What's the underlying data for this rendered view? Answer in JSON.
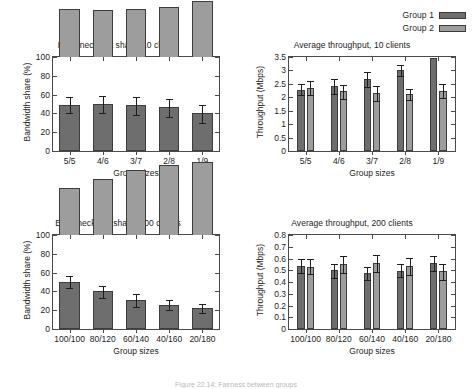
{
  "figure": {
    "caption": "Figure 22.14:  Fairness between groups",
    "legend": {
      "position": "top-right",
      "entries": [
        {
          "label": "Group 1",
          "color": "#6e6e6e"
        },
        {
          "label": "Group 2",
          "color": "#9d9d9d"
        }
      ]
    }
  },
  "chart_data": [
    {
      "id": "bottleneck-10",
      "type": "bar",
      "stacked": true,
      "title": "Bottleneck link share, 10 clients",
      "xlabel": "Group sizes",
      "ylabel": "Bandwidth share (%)",
      "categories": [
        "5/5",
        "4/6",
        "3/7",
        "2/8",
        "1/9"
      ],
      "ylim": [
        0,
        100
      ],
      "yticks": [
        0,
        20,
        40,
        60,
        80,
        100
      ],
      "ytick_labels": [
        "0",
        "20",
        "40",
        "60",
        "80",
        "100"
      ],
      "grid": false,
      "series": [
        {
          "name": "Group 1",
          "color": "#6e6e6e",
          "values": [
            49,
            50,
            49,
            47,
            40
          ],
          "err_low": [
            9,
            10,
            11,
            11,
            10
          ],
          "err_high": [
            8,
            9,
            8,
            8,
            9
          ]
        },
        {
          "name": "Group 2",
          "color": "#9d9d9d",
          "values": [
            51,
            50,
            51,
            53,
            60
          ]
        }
      ]
    },
    {
      "id": "throughput-10",
      "type": "bar",
      "stacked": false,
      "title": "Average throughput, 10 clients",
      "xlabel": "Group sizes",
      "ylabel": "Throughput (Mbps)",
      "categories": [
        "5/5",
        "4/6",
        "3/7",
        "2/8",
        "1/9"
      ],
      "ylim": [
        0,
        3.5
      ],
      "yticks": [
        0,
        0.5,
        1,
        1.5,
        2,
        2.5,
        3,
        3.5
      ],
      "ytick_labels": [
        "0",
        "0.5",
        "1",
        "1.5",
        "2",
        "2.5",
        "3",
        "3.5"
      ],
      "grid": false,
      "series": [
        {
          "name": "Group 1",
          "color": "#6e6e6e",
          "values": [
            2.28,
            2.42,
            2.68,
            3.01,
            3.45
          ],
          "err_low": [
            0.21,
            0.3,
            0.28,
            0.2,
            0.0
          ],
          "err_high": [
            0.21,
            0.26,
            0.28,
            0.18,
            0.0
          ]
        },
        {
          "name": "Group 2",
          "color": "#9d9d9d",
          "values": [
            2.35,
            2.23,
            2.15,
            2.12,
            2.24
          ],
          "err_low": [
            0.28,
            0.3,
            0.27,
            0.22,
            0.25
          ],
          "err_high": [
            0.25,
            0.24,
            0.28,
            0.2,
            0.27
          ]
        }
      ]
    },
    {
      "id": "bottleneck-200",
      "type": "bar",
      "stacked": true,
      "title": "Bottleneck link share, 200 clients",
      "xlabel": "Group sizes",
      "ylabel": "Bandwidth share (%)",
      "categories": [
        "100/100",
        "80/120",
        "60/140",
        "40/160",
        "20/180"
      ],
      "ylim": [
        0,
        100
      ],
      "yticks": [
        0,
        20,
        40,
        60,
        80,
        100
      ],
      "ytick_labels": [
        "0",
        "20",
        "40",
        "60",
        "80",
        "100"
      ],
      "grid": false,
      "series": [
        {
          "name": "Group 1",
          "color": "#6e6e6e",
          "values": [
            50,
            40,
            31,
            26,
            22
          ],
          "err_low": [
            6,
            7,
            8,
            6,
            5
          ],
          "err_high": [
            6,
            6,
            6,
            5,
            5
          ]
        },
        {
          "name": "Group 2",
          "color": "#9d9d9d",
          "values": [
            50,
            60,
            69,
            74,
            78
          ]
        }
      ]
    },
    {
      "id": "throughput-200",
      "type": "bar",
      "stacked": false,
      "title": "Average throughput, 200 clients",
      "xlabel": "Group sizes",
      "ylabel": "Throughput (Mbps)",
      "categories": [
        "100/100",
        "80/120",
        "60/140",
        "40/160",
        "20/180"
      ],
      "ylim": [
        0,
        0.8
      ],
      "yticks": [
        0,
        0.1,
        0.2,
        0.3,
        0.4,
        0.5,
        0.6,
        0.7,
        0.8
      ],
      "ytick_labels": [
        "0",
        "0.1",
        "0.2",
        "0.3",
        "0.4",
        "0.5",
        "0.6",
        "0.7",
        "0.8"
      ],
      "grid": false,
      "series": [
        {
          "name": "Group 1",
          "color": "#6e6e6e",
          "values": [
            0.535,
            0.5,
            0.475,
            0.497,
            0.565
          ],
          "err_low": [
            0.055,
            0.07,
            0.055,
            0.055,
            0.07
          ],
          "err_high": [
            0.06,
            0.055,
            0.05,
            0.055,
            0.06
          ]
        },
        {
          "name": "Group 2",
          "color": "#9d9d9d",
          "values": [
            0.532,
            0.555,
            0.562,
            0.537,
            0.495
          ],
          "err_low": [
            0.065,
            0.075,
            0.075,
            0.075,
            0.075
          ],
          "err_high": [
            0.065,
            0.065,
            0.07,
            0.065,
            0.06
          ]
        }
      ]
    }
  ]
}
